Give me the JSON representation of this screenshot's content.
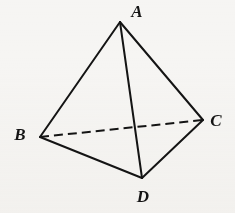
{
  "figure": {
    "name": "tetrahedron",
    "caption_text": "",
    "background_color": "#f6f5f3",
    "stroke_color": "#141414",
    "label_color": "#141414",
    "stroke_width": 2,
    "dash_pattern": "9 5",
    "width": 235,
    "height": 213
  },
  "vertices": [
    {
      "id": "A",
      "label": "A",
      "x": 120,
      "y": 22,
      "label_x": 137,
      "label_y": 11
    },
    {
      "id": "B",
      "label": "B",
      "x": 40,
      "y": 137,
      "label_x": 20,
      "label_y": 134
    },
    {
      "id": "C",
      "label": "C",
      "x": 203,
      "y": 120,
      "label_x": 216,
      "label_y": 120
    },
    {
      "id": "D",
      "label": "D",
      "x": 142,
      "y": 178,
      "label_x": 143,
      "label_y": 196
    }
  ],
  "edges": [
    {
      "id": "AB",
      "from": "A",
      "to": "B",
      "style": "solid",
      "x1": 120,
      "y1": 22,
      "x2": 40,
      "y2": 137
    },
    {
      "id": "AC",
      "from": "A",
      "to": "C",
      "style": "solid",
      "x1": 120,
      "y1": 22,
      "x2": 203,
      "y2": 120
    },
    {
      "id": "AD",
      "from": "A",
      "to": "D",
      "style": "solid",
      "x1": 120,
      "y1": 22,
      "x2": 142,
      "y2": 178
    },
    {
      "id": "BD",
      "from": "B",
      "to": "D",
      "style": "solid",
      "x1": 40,
      "y1": 137,
      "x2": 142,
      "y2": 178
    },
    {
      "id": "DC",
      "from": "D",
      "to": "C",
      "style": "solid",
      "x1": 142,
      "y1": 178,
      "x2": 203,
      "y2": 120
    },
    {
      "id": "BC",
      "from": "B",
      "to": "C",
      "style": "dashed",
      "x1": 40,
      "y1": 137,
      "x2": 203,
      "y2": 120
    }
  ]
}
